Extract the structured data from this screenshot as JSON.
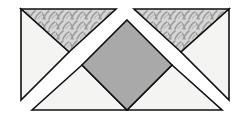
{
  "diagram": {
    "title": "",
    "colors": {
      "background": "#ffffff",
      "outline": "#111111",
      "light_fill": "#f4f4f2",
      "diamond_fill": "#a9a9a9",
      "pattern_base": "#d4d4d4",
      "pattern_stroke": "#9a9a9a"
    },
    "pieces": [
      {
        "name": "top-left-patterned-triangle",
        "points": "21,9 116,9 69,52",
        "fill": "pattern"
      },
      {
        "name": "top-left-white-triangle",
        "points": "21,9 69,52 21,100",
        "fill": "light"
      },
      {
        "name": "top-right-patterned-triangle",
        "points": "134,9 229,9 181,52",
        "fill": "pattern"
      },
      {
        "name": "top-right-white-triangle",
        "points": "229,9 181,52 229,100",
        "fill": "light"
      },
      {
        "name": "bottom-left-white-triangle",
        "points": "32,110 82,65 127,110",
        "fill": "light"
      },
      {
        "name": "bottom-right-white-triangle",
        "points": "127,110 172,65 222,110",
        "fill": "light"
      },
      {
        "name": "center-gray-diamond",
        "points": "127,20 172,65 127,110 82,65",
        "fill": "diamond"
      }
    ]
  }
}
